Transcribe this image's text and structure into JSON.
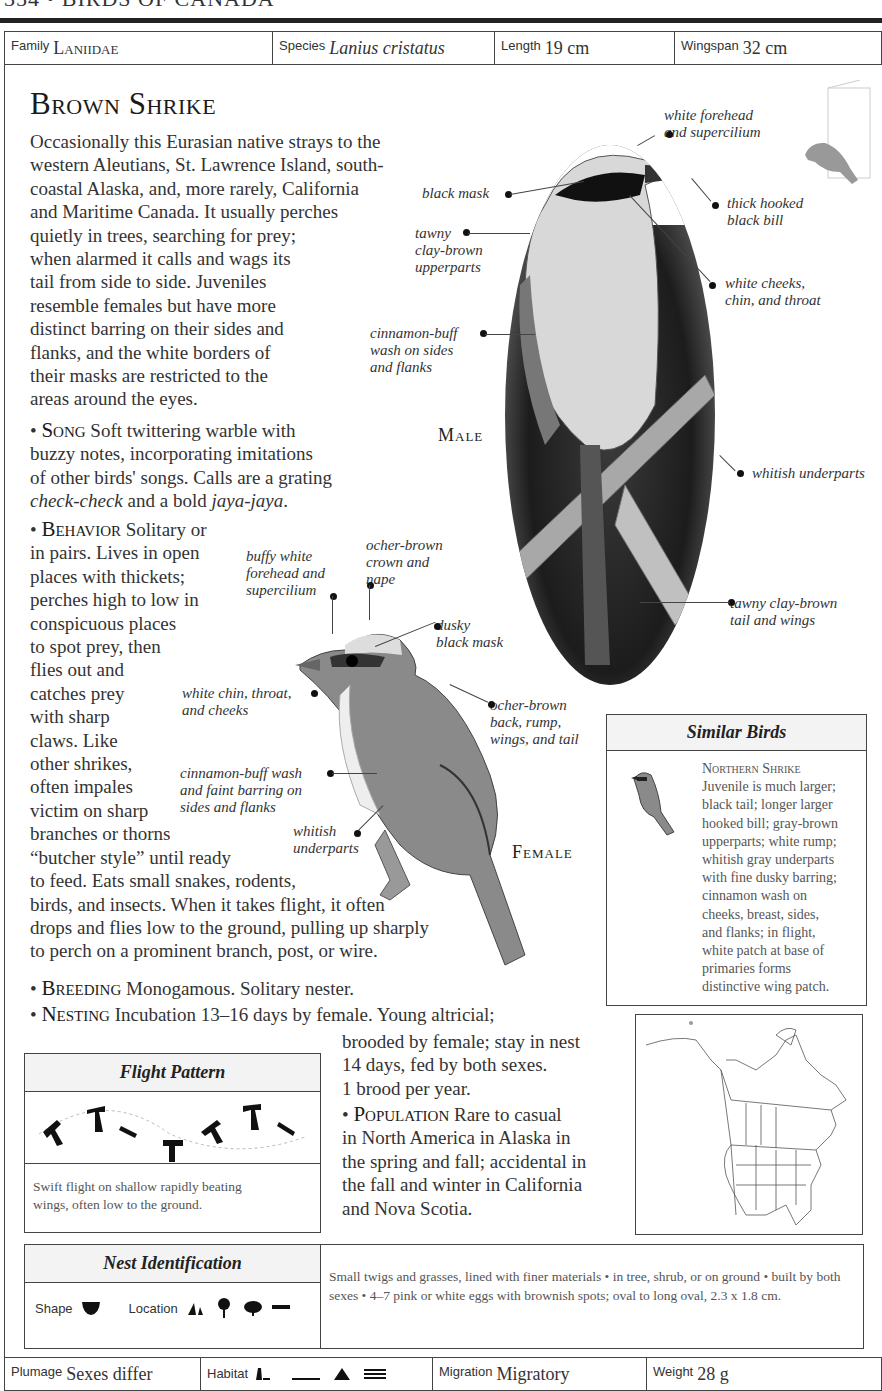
{
  "page": {
    "running_head": "354 • BIRDS OF CANADA"
  },
  "top_bar": {
    "family_label": "Family",
    "family_value": "Laniidae",
    "species_label": "Species",
    "species_value": "Lanius cristatus",
    "length_label": "Length",
    "length_value": "19 cm",
    "wingspan_label": "Wingspan",
    "wingspan_value": "32 cm"
  },
  "title": "Brown Shrike",
  "intro": "Occasionally this Eurasian native strays to the\nwestern Aleutians, St. Lawrence Island, south-\ncoastal Alaska, and, more rarely, California\nand Maritime Canada. It usually perches\nquietly in trees, searching for prey;\nwhen alarmed it calls and wags its\ntail from side to side. Juveniles\nresemble females but have more\ndistinct barring on their sides and\nflanks, and the white borders of\ntheir masks are restricted to the\nareas around the eyes.",
  "song": {
    "heading": "Song",
    "text": " Soft twittering warble with\nbuzzy notes, incorporating imitations\nof other birds' songs. Calls are a grating\n",
    "call1": "check-check",
    "mid": " and a bold ",
    "call2": "jaya-jaya",
    "end": "."
  },
  "behavior": {
    "heading": "Behavior",
    "text": " Solitary or\nin pairs. Lives in open\nplaces with thickets;\nperches high to low in\nconspicuous places\nto spot prey, then\nflies out and\ncatches prey\nwith sharp\nclaws. Like\nother shrikes,\noften impales\nvictim on sharp\nbranches or thorns\n“butcher style” until ready\nto feed. Eats small snakes, rodents,\nbirds, and insects. When it takes flight, it often\ndrops and flies low to the ground, pulling up sharply\nto perch on a prominent branch, post, or wire."
  },
  "breeding": {
    "heading": "Breeding",
    "text": " Monogamous. Solitary nester."
  },
  "nesting": {
    "heading": "Nesting",
    "text": " Incubation 13–16 days by female. Young altricial;",
    "cont": "brooded by female; stay in nest\n14 days, fed by both sexes.\n1 brood per year."
  },
  "population": {
    "heading": "Population",
    "text": " Rare to casual\nin North America in Alaska in\nthe spring and fall; accidental in\nthe fall and winter in California\nand Nova Scotia."
  },
  "male": {
    "label": "Male",
    "annotations": {
      "forehead": "white forehead\n  and supercilium",
      "mask": "black mask",
      "bill": "thick hooked\nblack bill",
      "upperparts": "tawny\nclay-brown\nupperparts",
      "cheeks": "white cheeks,\nchin, and throat",
      "flanks": "cinnamon-buff\nwash on sides\nand flanks",
      "underparts": "whitish underparts",
      "tail": "tawny clay-brown\ntail and wings"
    }
  },
  "female": {
    "label": "Female",
    "annotations": {
      "forehead": "buffy white\nforehead and\nsupercilium",
      "crown": "ocher-brown\ncrown and\n   nape",
      "mask": "dusky\nblack mask",
      "chin": "white chin, throat,\nand cheeks",
      "back": "ocher-brown\nback, rump,\nwings, and tail",
      "flanks": "cinnamon-buff wash\nand faint barring on\nsides and flanks",
      "underparts": "whitish\nunderparts"
    }
  },
  "similar_birds": {
    "title": "Similar Birds",
    "name": "Northern Shrike",
    "text": "Juvenile is much larger;\nblack tail; longer larger\nhooked bill; gray-brown\nupperparts; white rump;\nwhitish gray underparts\nwith fine dusky barring;\ncinnamon wash on\ncheeks, breast, sides,\nand flanks; in flight,\nwhite patch at base of\nprimaries forms\ndistinctive wing patch."
  },
  "flight_pattern": {
    "title": "Flight Pattern",
    "caption": "Swift flight on shallow rapidly beating\nwings, often low to the ground."
  },
  "nest_identification": {
    "title": "Nest Identification",
    "shape_label": "Shape",
    "location_label": "Location",
    "description": "Small twigs and grasses, lined with finer materials • in tree, shrub, or on ground • built by both sexes • 4–7 pink or white eggs with brownish spots; oval to long oval, 2.3 x 1.8 cm."
  },
  "bottom_bar": {
    "plumage_label": "Plumage",
    "plumage_value": "Sexes differ",
    "habitat_label": "Habitat",
    "migration_label": "Migration",
    "migration_value": "Migratory",
    "weight_label": "Weight",
    "weight_value": "28 g"
  }
}
